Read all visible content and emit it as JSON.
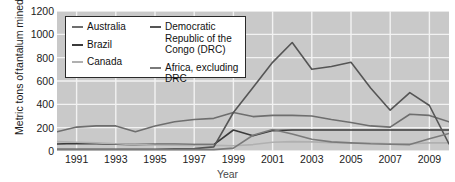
{
  "chart_data": {
    "type": "line",
    "title": "",
    "xlabel": "Year",
    "ylabel_line1": "Metric tons of",
    "ylabel_line2": "tantalum mined",
    "xlim": [
      1990,
      2010
    ],
    "ylim": [
      0,
      1200
    ],
    "yticks": [
      0,
      200,
      400,
      600,
      800,
      1000,
      1200
    ],
    "xticks": [
      1991,
      1993,
      1995,
      1997,
      1999,
      2001,
      2003,
      2005,
      2007,
      2009
    ],
    "x": [
      1990,
      1991,
      1992,
      1993,
      1994,
      1995,
      1996,
      1997,
      1998,
      1999,
      2000,
      2001,
      2002,
      2003,
      2004,
      2005,
      2006,
      2007,
      2008,
      2009,
      2010
    ],
    "grid": true,
    "legend_position": "upper-left-inside",
    "plot_background": "#c9c9c9",
    "gridline_color": "#f2f2f2",
    "series": [
      {
        "name": "Australia",
        "color": "#6e6e6e",
        "values": [
          165,
          205,
          215,
          215,
          165,
          215,
          250,
          270,
          280,
          330,
          295,
          305,
          305,
          300,
          270,
          245,
          215,
          205,
          315,
          305,
          250
        ]
      },
      {
        "name": "Brazil",
        "color": "#3a3a3a",
        "values": [
          60,
          65,
          62,
          58,
          55,
          58,
          58,
          55,
          55,
          180,
          130,
          175,
          180,
          180,
          180,
          180,
          180,
          180,
          180,
          180,
          180
        ]
      },
      {
        "name": "Canada",
        "color": "#b0b0b0",
        "values": [
          80,
          75,
          70,
          62,
          55,
          52,
          50,
          48,
          48,
          45,
          55,
          75,
          80,
          78,
          72,
          70,
          68,
          62,
          62,
          70,
          70
        ]
      },
      {
        "name": "Democratic Republic of the Congo (DRC)",
        "color": "#555555",
        "values": [
          15,
          15,
          15,
          15,
          15,
          15,
          18,
          20,
          35,
          330,
          545,
          760,
          930,
          700,
          725,
          760,
          540,
          350,
          500,
          390,
          60
        ]
      },
      {
        "name": "Africa, excluding DRC",
        "color": "#7a7a7a",
        "values": [
          12,
          12,
          12,
          12,
          12,
          12,
          12,
          12,
          12,
          25,
          135,
          185,
          145,
          100,
          78,
          70,
          62,
          58,
          55,
          105,
          150
        ]
      }
    ]
  },
  "legend": {
    "column1": [
      {
        "label": "Australia",
        "color": "#6e6e6e"
      },
      {
        "label": "Brazil",
        "color": "#3a3a3a"
      },
      {
        "label": "Canada",
        "color": "#b0b0b0"
      }
    ],
    "column2": [
      {
        "label": "Democratic Republic of the Congo (DRC)",
        "color": "#555555"
      },
      {
        "label": "Africa, excluding DRC",
        "color": "#7a7a7a"
      }
    ]
  }
}
